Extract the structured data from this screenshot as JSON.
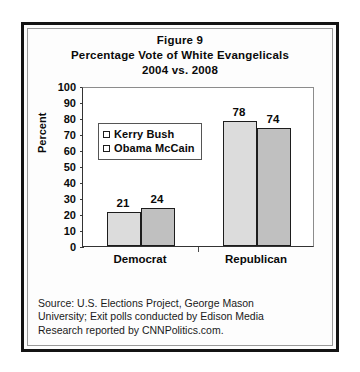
{
  "figure": {
    "title_lines": [
      "Figure 9",
      "Percentage Vote of White Evangelicals",
      "2004 vs. 2008"
    ],
    "source_lines": [
      "Source: U.S. Elections Project, George Mason",
      "University; Exit polls conducted by Edison Media",
      "Research reported by CNNPolitics.com."
    ]
  },
  "chart_data": {
    "type": "bar",
    "categories": [
      "Democrat",
      "Republican"
    ],
    "series": [
      {
        "name": "Kerry Bush",
        "values": [
          21,
          78
        ]
      },
      {
        "name": "Obama McCain",
        "values": [
          24,
          74
        ]
      }
    ],
    "xlabel": "",
    "ylabel": "Percent",
    "ylim": [
      0,
      100
    ],
    "yticks": [
      0,
      10,
      20,
      30,
      40,
      50,
      60,
      70,
      80,
      90,
      100
    ],
    "ytick_labels": [
      "0",
      "10",
      "20",
      "30",
      "40",
      "50",
      "60",
      "70",
      "80",
      "90",
      "100"
    ],
    "grid": false,
    "legend_position": "upper-left-inside",
    "data_labels": true,
    "colors": {
      "series_0_fill": "#dcdcdc",
      "series_1_fill": "#c0c0c0",
      "bar_outline": "#1d1d1d",
      "text": "#0a0a0a"
    }
  }
}
